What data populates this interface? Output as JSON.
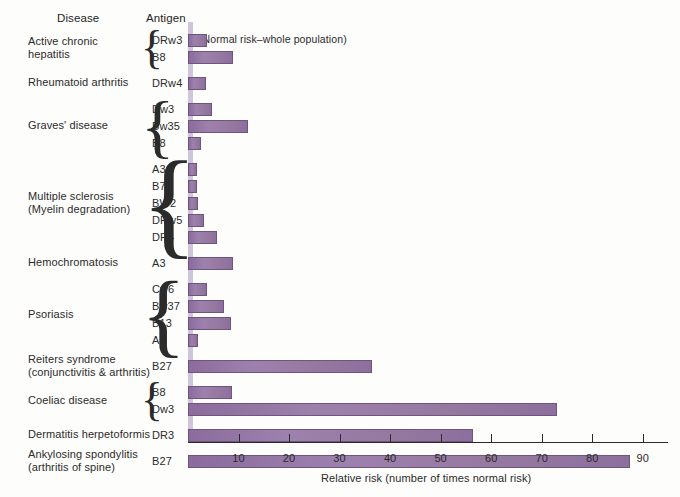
{
  "header": {
    "disease_column": "Disease",
    "antigen_column": "Antigen",
    "reference_note": "(Normal risk–whole population)"
  },
  "chart_data": {
    "type": "bar",
    "orientation": "horizontal",
    "title": "",
    "xlabel": "Relative risk (number of times normal risk)",
    "ylabel": "",
    "xlim": [
      0,
      95
    ],
    "xticks": [
      10,
      20,
      30,
      40,
      50,
      60,
      70,
      80,
      90
    ],
    "xtick_labels": [
      "10",
      "20",
      "30",
      "40",
      "50",
      "60",
      "70",
      "80",
      "90"
    ],
    "grid": false,
    "legend": false,
    "reference_value": 1,
    "reference_label": "(Normal risk–whole population)",
    "bar_color": "#8d6f9e",
    "reference_band_color": "#cfc6dc",
    "groups": [
      {
        "disease": "Active chronic\nhepatitis",
        "disease_lines": [
          "Active chronic",
          "hepatitis"
        ],
        "braced": true,
        "antigens": [
          "DRw3",
          "B8"
        ],
        "values": [
          3.8,
          9.0
        ]
      },
      {
        "disease": "Rheumatoid arthritis",
        "disease_lines": [
          "Rheumatoid arthritis"
        ],
        "braced": false,
        "antigens": [
          "DRw4"
        ],
        "values": [
          3.6
        ]
      },
      {
        "disease": "Graves' disease",
        "disease_lines": [
          "Graves' disease"
        ],
        "braced": true,
        "antigens": [
          "Dw3",
          "Bw35",
          "B8"
        ],
        "values": [
          4.7,
          11.9,
          2.6
        ]
      },
      {
        "disease": "Multiple sclerosis\n(Myelin degradation)",
        "disease_lines": [
          "Multiple sclerosis",
          "(Myelin degradation)"
        ],
        "braced": true,
        "antigens": [
          "A3",
          "B7",
          "BW2",
          "DRw5",
          "DR4"
        ],
        "values": [
          1.7,
          1.8,
          2.0,
          3.2,
          5.8
        ]
      },
      {
        "disease": "Hemochromatosis",
        "disease_lines": [
          "Hemochromatosis"
        ],
        "braced": false,
        "antigens": [
          "A3"
        ],
        "values": [
          9.0
        ]
      },
      {
        "disease": "Psoriasis",
        "disease_lines": [
          "Psoriasis"
        ],
        "braced": true,
        "antigens": [
          "Cw6",
          "Bw37",
          "B13",
          "A1"
        ],
        "values": [
          3.8,
          7.2,
          8.5,
          1.9
        ]
      },
      {
        "disease": "Reiters syndrome\n(conjunctivitis & arthritis)",
        "disease_lines": [
          "Reiters syndrome",
          "(conjunctivitis & arthritis)"
        ],
        "braced": false,
        "antigens": [
          "B27"
        ],
        "values": [
          36.5
        ]
      },
      {
        "disease": "Coeliac disease",
        "disease_lines": [
          "Coeliac disease"
        ],
        "braced": true,
        "antigens": [
          "B8",
          "Dw3"
        ],
        "values": [
          8.8,
          73.0
        ]
      },
      {
        "disease": "Dermatitis herpetoformis",
        "disease_lines": [
          "Dermatitis herpetoformis"
        ],
        "braced": false,
        "antigens": [
          "DR3"
        ],
        "values": [
          56.4
        ]
      },
      {
        "disease": "Ankylosing spondylitis\n(arthritis of spine)",
        "disease_lines": [
          "Ankylosing spondylitis",
          "(arthritis of spine)"
        ],
        "braced": false,
        "antigens": [
          "B27"
        ],
        "values": [
          87.4
        ]
      }
    ]
  }
}
